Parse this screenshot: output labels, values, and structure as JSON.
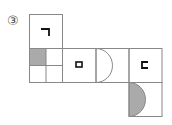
{
  "problem": {
    "number_label": "③"
  },
  "net": {
    "cells": [
      {
        "id": "top",
        "x": 29,
        "y": 14,
        "glyph": "ㄱ"
      },
      {
        "id": "quad",
        "x": 29,
        "y": 48,
        "glyph": ""
      },
      {
        "id": "middle",
        "x": 62,
        "y": 48,
        "glyph": "ㅁ"
      },
      {
        "id": "semicircle-outline",
        "x": 96,
        "y": 48,
        "glyph": ""
      },
      {
        "id": "right",
        "x": 129,
        "y": 48,
        "glyph": "ㄷ"
      },
      {
        "id": "bottom",
        "x": 129,
        "y": 82,
        "glyph": ""
      }
    ],
    "colors": {
      "line": "#888888",
      "shade": "#aaaaaa",
      "glyph": "#111111"
    }
  }
}
